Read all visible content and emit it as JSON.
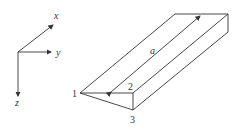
{
  "axes": {
    "x_label": "x",
    "y_label": "y",
    "z_label": "z"
  },
  "prism": {
    "vertex_labels": [
      "1",
      "2",
      "3"
    ],
    "length_label": "a"
  },
  "colors": {
    "stroke": "#333333",
    "background": "#ffffff"
  }
}
